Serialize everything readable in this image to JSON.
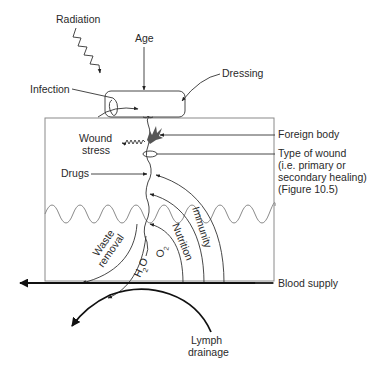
{
  "diagram": {
    "labels": {
      "radiation": "Radiation",
      "age": "Age",
      "dressing": "Dressing",
      "infection": "Infection",
      "foreign_body": "Foreign body",
      "wound_stress_1": "Wound",
      "wound_stress_2": "stress",
      "type_of_wound_1": "Type of wound",
      "type_of_wound_2": "(i.e. primary or",
      "type_of_wound_3": "secondary healing)",
      "type_of_wound_4": "(Figure 10.5)",
      "drugs": "Drugs",
      "immunity": "Immunity",
      "nutrition": "Nutrition",
      "waste_1": "Waste",
      "waste_2": "removal",
      "h2o": "H",
      "h2o_sub": "2",
      "h2o_o": "O",
      "o2": "O",
      "o2_sub": "2",
      "blood_supply": "Blood supply",
      "lymph_1": "Lymph",
      "lymph_2": "drainage"
    },
    "colors": {
      "line": "#333333",
      "box": "#8a8a8a",
      "foreign_body": "#555555",
      "text": "#2a2a2a"
    }
  }
}
